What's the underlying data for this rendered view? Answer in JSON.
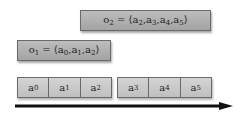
{
  "observations": [
    {
      "id": "o2",
      "label": "o",
      "sub": "2",
      "eq": " = ⟨",
      "items": [
        {
          "v": "a",
          "s": "2"
        },
        {
          "v": "a",
          "s": "3"
        },
        {
          "v": "a",
          "s": "4"
        },
        {
          "v": "a",
          "s": "5"
        }
      ],
      "close": "⟩"
    },
    {
      "id": "o1",
      "label": "o",
      "sub": "1",
      "eq": " = ⟨",
      "items": [
        {
          "v": "a",
          "s": "0"
        },
        {
          "v": "a",
          "s": "1"
        },
        {
          "v": "a",
          "s": "2"
        }
      ],
      "close": "⟩"
    }
  ],
  "sequence": {
    "group1": [
      {
        "v": "a",
        "s": "0"
      },
      {
        "v": "a",
        "s": "1"
      },
      {
        "v": "a",
        "s": "2"
      }
    ],
    "group2": [
      {
        "v": "a",
        "s": "3"
      },
      {
        "v": "a",
        "s": "4"
      },
      {
        "v": "a",
        "s": "5"
      }
    ]
  },
  "arrow": {
    "label": "time-axis",
    "color": "#111111"
  },
  "colors": {
    "box_fill": "#b0b0b0",
    "cell_fill": "#c9c9c9",
    "border": "#6a6a6a"
  }
}
